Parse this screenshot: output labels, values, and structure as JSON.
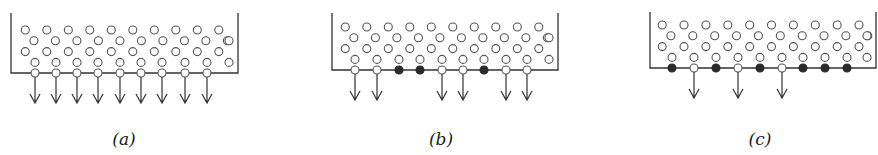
{
  "figure": {
    "panels": [
      {
        "label": "(a)",
        "box": {
          "left": 11,
          "right": 238,
          "top": 13,
          "bottom": 73
        },
        "bottom_sites": [
          {
            "x": 35,
            "state": "open",
            "arrow": true
          },
          {
            "x": 56,
            "state": "open",
            "arrow": true
          },
          {
            "x": 77,
            "state": "open",
            "arrow": true
          },
          {
            "x": 98,
            "state": "open",
            "arrow": true
          },
          {
            "x": 120,
            "state": "open",
            "arrow": true
          },
          {
            "x": 141,
            "state": "open",
            "arrow": true
          },
          {
            "x": 162,
            "state": "open",
            "arrow": true
          },
          {
            "x": 185,
            "state": "open",
            "arrow": true
          },
          {
            "x": 207,
            "state": "open",
            "arrow": true
          }
        ],
        "label_x": 124
      },
      {
        "label": "(b)",
        "box": {
          "left": 332,
          "right": 558,
          "top": 13,
          "bottom": 70
        },
        "bottom_sites": [
          {
            "x": 355,
            "state": "open",
            "arrow": true
          },
          {
            "x": 377,
            "state": "open",
            "arrow": true
          },
          {
            "x": 399,
            "state": "filled",
            "arrow": false
          },
          {
            "x": 420,
            "state": "filled",
            "arrow": false
          },
          {
            "x": 442,
            "state": "open",
            "arrow": true
          },
          {
            "x": 463,
            "state": "open",
            "arrow": true
          },
          {
            "x": 484,
            "state": "filled",
            "arrow": false
          },
          {
            "x": 506,
            "state": "open",
            "arrow": true
          },
          {
            "x": 527,
            "state": "open",
            "arrow": true
          }
        ],
        "label_x": 441
      },
      {
        "label": "(c)",
        "box": {
          "left": 650,
          "right": 876,
          "top": 12,
          "bottom": 68
        },
        "bottom_sites": [
          {
            "x": 672,
            "state": "filled",
            "arrow": false
          },
          {
            "x": 694,
            "state": "open",
            "arrow": true
          },
          {
            "x": 716,
            "state": "filled",
            "arrow": false
          },
          {
            "x": 738,
            "state": "open",
            "arrow": true
          },
          {
            "x": 760,
            "state": "filled",
            "arrow": false
          },
          {
            "x": 782,
            "state": "open",
            "arrow": true
          },
          {
            "x": 803,
            "state": "filled",
            "arrow": false
          },
          {
            "x": 825,
            "state": "filled",
            "arrow": false
          },
          {
            "x": 847,
            "state": "filled",
            "arrow": false
          }
        ],
        "label_x": 760
      }
    ]
  }
}
